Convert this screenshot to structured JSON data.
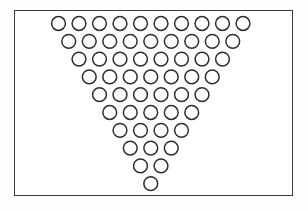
{
  "diagram": {
    "total_circles": 55,
    "row_count": 10,
    "rows_per_count": [
      10,
      9,
      8,
      7,
      6,
      5,
      4,
      3,
      2,
      1
    ],
    "orientation": "point-down",
    "stagger": "each row offset half a pitch to the right of the row above",
    "colors": {
      "page_background": "#ffffff",
      "frame_interior": "#ffffff",
      "frame_border": "#3a3a3c",
      "circle_fill": "#ffffff",
      "circle_stroke": "#2e2e30"
    },
    "geometry": {
      "frame_x": 14,
      "frame_y": 10,
      "frame_width": 279,
      "frame_height": 186,
      "frame_border_width": 1.6,
      "circle_radius": 6.9,
      "circle_stroke_width": 1.5,
      "column_pitch": 20.5,
      "row_pitch": 17.8,
      "row_half_offset": 10.25,
      "first_row_first_center_x": 58.5,
      "first_row_center_y": 23.5
    },
    "labels": {
      "row_label_prefix": "Row",
      "circle_label_prefix": "Circle"
    }
  }
}
